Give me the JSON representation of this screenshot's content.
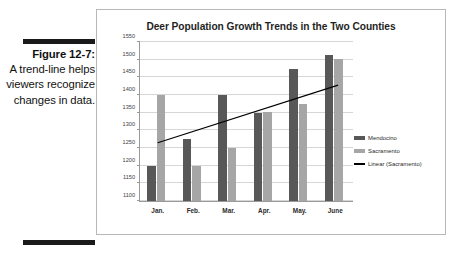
{
  "caption": {
    "figure_label": "Figure 12-7:",
    "body": "A trend-line helps viewers recognize changes in data."
  },
  "chart_data": {
    "type": "bar",
    "title": "Deer Population Growth Trends in the Two Counties",
    "xlabel": "",
    "ylabel": "",
    "categories": [
      "Jan.",
      "Feb.",
      "Mar.",
      "Apr.",
      "May.",
      "June"
    ],
    "series": [
      {
        "name": "Mendocino",
        "color": "#585858",
        "values": [
          1200,
          1275,
          1400,
          1350,
          1475,
          1512
        ]
      },
      {
        "name": "Sacramento",
        "color": "#a6a6a6",
        "values": [
          1400,
          1200,
          1250,
          1352,
          1375,
          1502
        ]
      }
    ],
    "trendline": {
      "name": "Linear (Sacramento)",
      "color": "#000000",
      "start_value": 1265,
      "end_value": 1428
    },
    "ylim": [
      1100,
      1550
    ],
    "yticks": [
      1100,
      1150,
      1200,
      1250,
      1300,
      1350,
      1400,
      1450,
      1500,
      1550
    ],
    "grid": true,
    "legend_position": "right",
    "legend": [
      "Mendocino",
      "Sacramento",
      "Linear (Sacramento)"
    ]
  }
}
